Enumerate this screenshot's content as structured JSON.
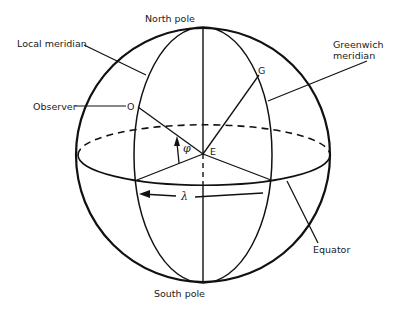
{
  "diagram": {
    "labels": {
      "north_pole": "North pole",
      "south_pole": "South pole",
      "local_meridian": "Local meridian",
      "greenwich_meridian_line1": "Greenwich",
      "greenwich_meridian_line2": "meridian",
      "observer": "Observer",
      "equator": "Equator"
    },
    "points": {
      "observer": "O",
      "greenwich": "G",
      "earth_center": "E"
    },
    "angles": {
      "latitude": "φ",
      "longitude": "λ"
    },
    "colors": {
      "stroke": "#111111",
      "background": "#ffffff"
    }
  }
}
